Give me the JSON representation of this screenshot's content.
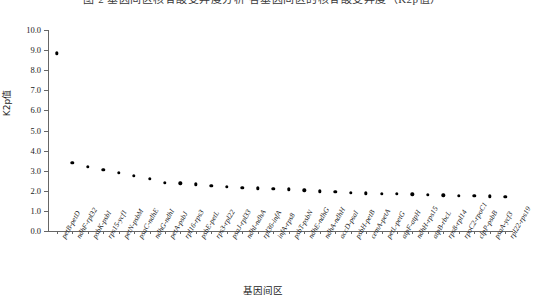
{
  "top_caption": {
    "text": "图 2 基因间区核苷酸变异度分析     各基因间区的核苷酸变异度（K2p值）"
  },
  "axes": {
    "ylabel": "K2p值",
    "xlabel": "基因间区",
    "yticks": [
      "0.0",
      "1.0",
      "2.0",
      "3.0",
      "4.0",
      "5.0",
      "6.0",
      "7.0",
      "8.0",
      "9.0",
      "10.0"
    ]
  },
  "chart_data": {
    "type": "scatter",
    "title": "",
    "xlabel": "基因间区",
    "ylabel": "K2p值",
    "ylim": [
      0.0,
      10.0
    ],
    "ytick_step": 1.0,
    "grid": false,
    "legend": "none",
    "marker": "filled-circle",
    "marker_color": "#000000",
    "categories": [
      "petB-petD",
      "ndhF-rpl32",
      "psbK-psbI",
      "rps15-ycf1",
      "petN-psbM",
      "psaC-ndhE",
      "ndhG-ndhI",
      "petA-psbJ",
      "rpl16-rps3",
      "psbE-petL",
      "rps3-rpl22",
      "psaJ-rpl33",
      "ndhI-ndhA",
      "rpl36-infA",
      "infA-rps8",
      "psbT-psbN",
      "ndhE-ndhG",
      "ndhA-ndhH",
      "accD-psaI",
      "psbH-petB",
      "cemA-petA",
      "petL-petG",
      "atpF-atpH",
      "ndhH-rps15",
      "atpB-rbcL",
      "rps8-rpl14",
      "rpoC2-rpoC1",
      "clpP-psbB",
      "psaA-ycf3",
      "rpl22-rps19"
    ],
    "values": [
      8.85,
      3.4,
      3.2,
      3.05,
      2.9,
      2.75,
      2.6,
      2.4,
      2.38,
      2.32,
      2.25,
      2.2,
      2.15,
      2.12,
      2.1,
      2.08,
      2.02,
      1.98,
      1.95,
      1.9,
      1.88,
      1.86,
      1.84,
      1.83,
      1.8,
      1.78,
      1.76,
      1.74,
      1.72,
      1.7
    ]
  }
}
